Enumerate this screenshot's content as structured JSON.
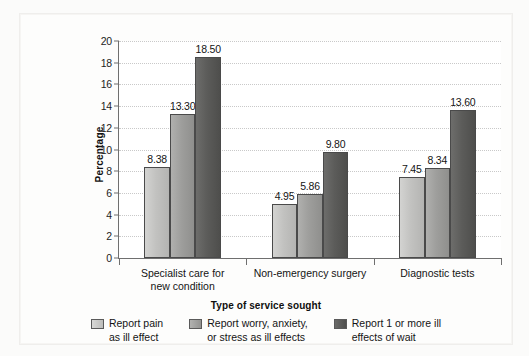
{
  "chart_data": {
    "type": "bar",
    "title": "",
    "xlabel": "Type of service sought",
    "ylabel": "Percentage",
    "ylim": [
      0,
      20
    ],
    "yticks": [
      0,
      2,
      4,
      6,
      8,
      10,
      12,
      14,
      16,
      18,
      20
    ],
    "grid": true,
    "legend_position": "bottom",
    "categories": [
      "Specialist care for new condition",
      "Non-emergency surgery",
      "Diagnostic tests"
    ],
    "category_lines": [
      [
        "Specialist care for",
        "new condition"
      ],
      [
        "Non-emergency surgery",
        ""
      ],
      [
        "Diagnostic tests",
        ""
      ]
    ],
    "series": [
      {
        "name": "Report pain as ill effect",
        "name_lines": [
          "Report pain",
          "as ill effect"
        ],
        "color": "#c6c6c4",
        "values": [
          8.38,
          4.95,
          7.45
        ],
        "labels": [
          "8.38",
          "4.95",
          "7.45"
        ]
      },
      {
        "name": "Report worry, anxiety, or stress as ill effects",
        "name_lines": [
          "Report worry, anxiety,",
          "or stress as ill effects"
        ],
        "color": "#9e9e9c",
        "values": [
          13.3,
          5.86,
          8.34
        ],
        "labels": [
          "13.30",
          "5.86",
          "8.34"
        ]
      },
      {
        "name": "Report 1 or more ill effects of wait",
        "name_lines": [
          "Report 1 or more ill",
          "effects of wait"
        ],
        "color": "#5a5a58",
        "values": [
          18.5,
          9.8,
          13.6
        ],
        "labels": [
          "18.50",
          "9.80",
          "13.60"
        ]
      }
    ]
  },
  "axis": {
    "y_tick_labels": [
      "0",
      "2",
      "4",
      "6",
      "8",
      "10",
      "12",
      "14",
      "16",
      "18",
      "20"
    ],
    "y_title": "Percentage",
    "x_title": "Type of service sought"
  },
  "group_labels": {
    "g0_line1": "Specialist care for",
    "g0_line2": "new condition",
    "g1_line1": "Non-emergency surgery",
    "g1_line2": "",
    "g2_line1": "Diagnostic tests",
    "g2_line2": ""
  },
  "legend": {
    "items": [
      {
        "line1": "Report pain",
        "line2": "as ill effect"
      },
      {
        "line1": "Report worry, anxiety,",
        "line2": "or stress as ill effects"
      },
      {
        "line1": "Report 1 or more ill",
        "line2": "effects of wait"
      }
    ]
  },
  "values": {
    "g0s0": "8.38",
    "g0s1": "13.30",
    "g0s2": "18.50",
    "g1s0": "4.95",
    "g1s1": "5.86",
    "g1s2": "9.80",
    "g2s0": "7.45",
    "g2s1": "8.34",
    "g2s2": "13.60"
  }
}
